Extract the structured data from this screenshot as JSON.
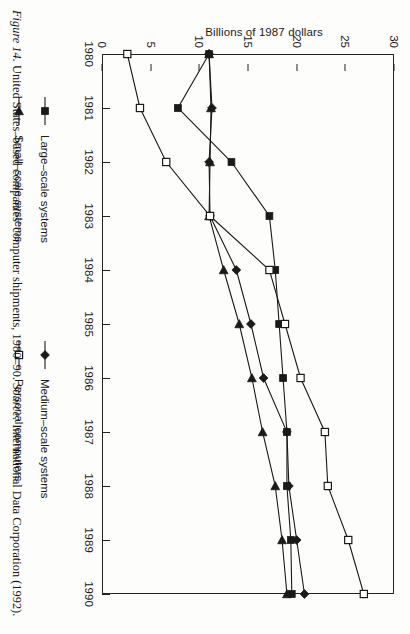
{
  "figure": {
    "caption_label": "Figure 14.",
    "caption_text": "United States–based companies' computer shipments, 1980–90.",
    "source_label": "Source:",
    "source_text": "International Data Corporation (1992)."
  },
  "legend": {
    "items": [
      {
        "label": "Large–scale systems",
        "marker": "filled-square-marker",
        "color": "#1a1a1a"
      },
      {
        "label": "Medium–scale systems",
        "marker": "filled-diamond-marker",
        "color": "#1a1a1a"
      },
      {
        "label": "Small–scale systems",
        "marker": "filled-triangle-marker",
        "color": "#1a1a1a"
      },
      {
        "label": "Personal computers",
        "marker": "open-square-marker",
        "color": "#1a1a1a"
      }
    ]
  },
  "chart_data": {
    "type": "line",
    "title": "",
    "xlabel": "",
    "ylabel": "Billions of 1987 dollars",
    "x": [
      1980,
      1981,
      1982,
      1983,
      1984,
      1985,
      1986,
      1987,
      1988,
      1989,
      1990
    ],
    "xtick_labels": [
      "1980",
      "1981",
      "1982",
      "1983",
      "1984",
      "1985",
      "1986",
      "1987",
      "1988",
      "1989",
      "1990"
    ],
    "ytick_labels": [
      "0",
      "5",
      "10",
      "15",
      "20",
      "25",
      "30"
    ],
    "yticks": [
      0,
      5,
      10,
      15,
      20,
      25,
      30
    ],
    "ylim": [
      0,
      30
    ],
    "xlim": [
      1980,
      1990
    ],
    "grid": false,
    "legend_position": "below",
    "series": [
      {
        "name": "Large–scale systems",
        "marker": "filled-square-marker",
        "values": [
          11.0,
          7.8,
          13.3,
          17.2,
          17.8,
          18.2,
          18.6,
          19.0,
          19.0,
          19.4,
          19.5
        ]
      },
      {
        "name": "Medium–scale systems",
        "marker": "filled-diamond-marker",
        "values": [
          11.0,
          11.3,
          11.0,
          11.1,
          13.8,
          15.3,
          16.6,
          19.0,
          19.2,
          20.0,
          20.8
        ]
      },
      {
        "name": "Small–scale systems",
        "marker": "filled-triangle-marker",
        "values": [
          11.0,
          11.2,
          11.1,
          11.0,
          12.5,
          14.1,
          15.4,
          16.5,
          17.8,
          18.5,
          19.0
        ]
      },
      {
        "name": "Personal computers",
        "marker": "open-square-marker",
        "values": [
          2.6,
          3.9,
          6.6,
          11.1,
          17.2,
          18.8,
          20.4,
          22.9,
          23.2,
          25.3,
          26.9
        ]
      }
    ]
  }
}
